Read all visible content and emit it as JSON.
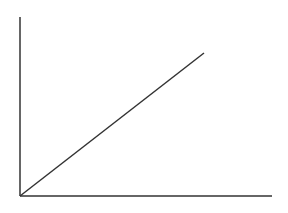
{
  "diagram": {
    "type": "line",
    "stroke_color": "#333333",
    "background": "#ffffff",
    "y_axis": {
      "x": 20,
      "y_top": 17,
      "y_bottom": 196
    },
    "x_axis": {
      "y": 196,
      "x_left": 20,
      "x_right": 272
    },
    "line": {
      "x1": 20,
      "y1": 196,
      "x2": 204,
      "y2": 53
    }
  }
}
